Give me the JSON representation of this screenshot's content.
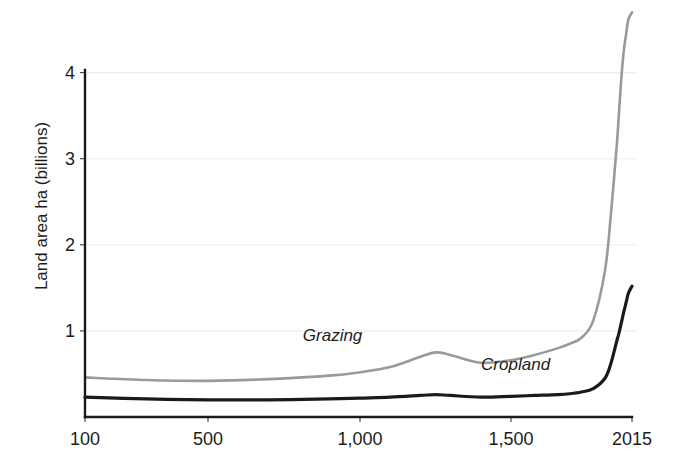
{
  "chart_data": {
    "type": "line",
    "title": "",
    "subtitle": "",
    "xlabel": "",
    "ylabel": "Land area ha (billions)",
    "grid": true,
    "legend_position": "inline-annotations",
    "xlim": [
      100,
      2015
    ],
    "ylim": [
      0,
      4.75
    ],
    "y_ticks": [
      1,
      2,
      3,
      4
    ],
    "y_tick_labels": [
      "1",
      "2",
      "3",
      "4"
    ],
    "x_ticks": [
      100,
      500,
      1000,
      1500,
      2015
    ],
    "x_tick_labels": [
      "100",
      "500",
      "1,000",
      "1,500",
      "2015"
    ],
    "x": [
      100,
      300,
      500,
      700,
      900,
      1000,
      1100,
      1200,
      1250,
      1300,
      1400,
      1500,
      1600,
      1700,
      1750,
      1800,
      1850,
      1900,
      1925,
      1950,
      1960,
      1970,
      1980,
      1990,
      2000,
      2015
    ],
    "series": [
      {
        "name": "Grazing",
        "color": "#9a9a9a",
        "label_x_year": 950,
        "label_y_value": 0.94,
        "values": [
          0.46,
          0.43,
          0.42,
          0.44,
          0.48,
          0.52,
          0.58,
          0.7,
          0.75,
          0.72,
          0.63,
          0.66,
          0.72,
          0.8,
          0.85,
          0.92,
          1.12,
          1.7,
          2.35,
          3.15,
          3.55,
          3.95,
          4.25,
          4.45,
          4.62,
          4.7
        ]
      },
      {
        "name": "Cropland",
        "color": "#1a1a1a",
        "label_x_year": 1560,
        "label_y_value": 0.6,
        "values": [
          0.23,
          0.21,
          0.2,
          0.2,
          0.21,
          0.22,
          0.23,
          0.25,
          0.26,
          0.25,
          0.23,
          0.24,
          0.25,
          0.26,
          0.27,
          0.29,
          0.33,
          0.45,
          0.62,
          0.88,
          0.98,
          1.1,
          1.22,
          1.33,
          1.44,
          1.52
        ]
      }
    ]
  },
  "axis": {
    "y_title": "Land area ha (billions)"
  },
  "annotations": {
    "grazing_label": "Grazing",
    "cropland_label": "Cropland"
  }
}
